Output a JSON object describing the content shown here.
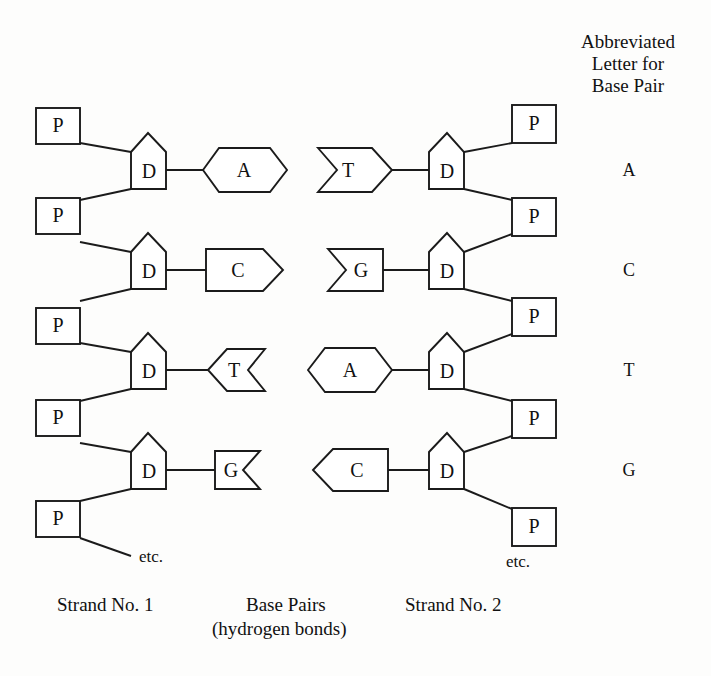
{
  "figure": {
    "ink_color": "#1b1b1b",
    "paper_color": "#fdfdfc"
  },
  "legend": {
    "heading_line1": "Abbreviated",
    "heading_line2": "Letter for",
    "heading_line3": "Base Pair",
    "letters": [
      "A",
      "C",
      "T",
      "G"
    ]
  },
  "captions": {
    "strand1": "Strand No. 1",
    "base_pairs_line1": "Base Pairs",
    "base_pairs_line2": "(hydrogen bonds)",
    "strand2": "Strand No. 2",
    "etc_left": "etc.",
    "etc_right": "etc."
  },
  "symbols": {
    "phosphate": "P",
    "deoxyribose": "D"
  },
  "strand1": {
    "name": "Strand No. 1",
    "phosphates": [
      "P",
      "P",
      "P",
      "P",
      "P"
    ],
    "sugars": [
      "D",
      "D",
      "D",
      "D"
    ],
    "bases": [
      "A",
      "C",
      "T",
      "G"
    ]
  },
  "strand2": {
    "name": "Strand No. 2",
    "phosphates": [
      "P",
      "P",
      "P",
      "P",
      "P"
    ],
    "sugars": [
      "D",
      "D",
      "D",
      "D"
    ],
    "bases": [
      "T",
      "G",
      "A",
      "C"
    ]
  },
  "base_pairs": [
    {
      "strand1_base": "A",
      "strand2_base": "T",
      "abbreviation": "A"
    },
    {
      "strand1_base": "C",
      "strand2_base": "G",
      "abbreviation": "C"
    },
    {
      "strand1_base": "T",
      "strand2_base": "A",
      "abbreviation": "T"
    },
    {
      "strand1_base": "G",
      "strand2_base": "C",
      "abbreviation": "G"
    }
  ],
  "base_shapes": {
    "A": "hexagon",
    "C": "pentagon-point-right",
    "T": "pentagon-notched",
    "G": "rectangle-notched"
  }
}
